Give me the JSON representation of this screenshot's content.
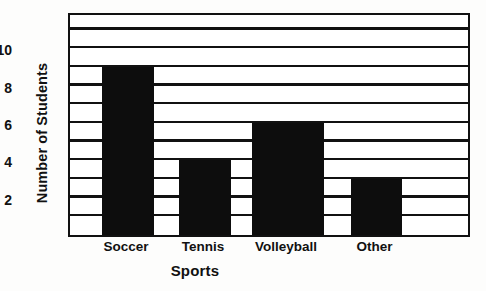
{
  "chart_data": {
    "type": "bar",
    "title": "",
    "title_cropped": true,
    "categories": [
      "Soccer",
      "Tennis",
      "Volleyball",
      "Other"
    ],
    "values": [
      9,
      4,
      6,
      3
    ],
    "series": [
      {
        "name": "Number of Students",
        "values": [
          9,
          4,
          6,
          3
        ]
      }
    ],
    "xlabel": "Sports",
    "ylabel": "Number of Students",
    "ylim": [
      0,
      12
    ],
    "ytick_labels": [
      "2",
      "4",
      "6",
      "8",
      "10"
    ],
    "ytick_values": [
      2,
      4,
      6,
      8,
      10
    ],
    "gridlines": [
      1,
      2,
      3,
      4,
      5,
      6,
      7,
      8,
      9,
      10,
      11
    ],
    "grid": true,
    "grid_orientation": "horizontal",
    "legend": null,
    "bar_color": "#0d0d0d",
    "frame_color": "#111111",
    "background_color": "#fdfdfc"
  },
  "axes": {
    "y_title": "Number of Students",
    "x_title": "Sports"
  }
}
